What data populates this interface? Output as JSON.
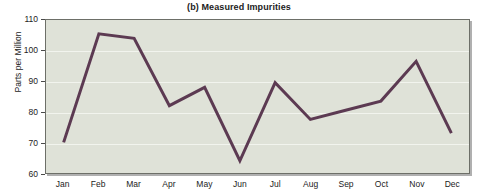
{
  "chart_data": {
    "type": "line",
    "title": "(b) Measured Impurities",
    "xlabel": "",
    "ylabel": "Parts per Million",
    "categories": [
      "Jan",
      "Feb",
      "Mar",
      "Apr",
      "May",
      "Jun",
      "Jul",
      "Aug",
      "Sep",
      "Oct",
      "Nov",
      "Dec"
    ],
    "values": [
      70,
      105.5,
      104,
      82,
      88,
      64,
      89.5,
      77.5,
      80.5,
      83.5,
      96.5,
      73
    ],
    "series": [
      {
        "name": "Measured Impurities",
        "values": [
          70,
          105.5,
          104,
          82,
          88,
          64,
          89.5,
          77.5,
          80.5,
          83.5,
          96.5,
          73
        ]
      }
    ],
    "ylim": [
      60,
      110
    ],
    "yticks": [
      60,
      70,
      80,
      90,
      100,
      110
    ],
    "ytick_labels": [
      "60",
      "70",
      "80",
      "90",
      "100",
      "110"
    ],
    "grid": true,
    "legend": "none",
    "line_color": "#5c3a52",
    "plot_background": "#dfe2d8",
    "gridline_color": "#f2f4ee",
    "axis_color": "#6d6f68",
    "markers": false
  }
}
